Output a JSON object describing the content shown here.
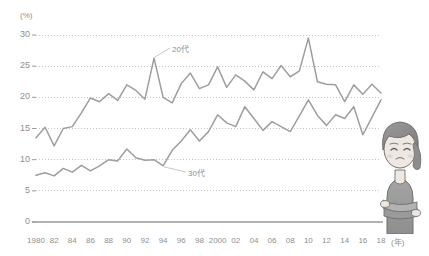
{
  "chart_data": {
    "type": "line",
    "title": "",
    "subtitle": "",
    "xlabel": "(年)",
    "ylabel": "(%)",
    "ylim": [
      0,
      30
    ],
    "xlim": [
      1980,
      2018
    ],
    "grid": true,
    "legend_position": "inline-annotation",
    "y_ticks": [
      "0",
      "5",
      "10",
      "15",
      "20",
      "25",
      "30"
    ],
    "y_tick_values": [
      0,
      5,
      10,
      15,
      20,
      25,
      30
    ],
    "x_ticks": [
      "1980",
      "82",
      "84",
      "86",
      "88",
      "90",
      "92",
      "94",
      "96",
      "98",
      "2000",
      "02",
      "04",
      "06",
      "08",
      "10",
      "12",
      "14",
      "16",
      "18"
    ],
    "x_tick_values": [
      1980,
      1982,
      1984,
      1986,
      1988,
      1990,
      1992,
      1994,
      1996,
      1998,
      2000,
      2002,
      2004,
      2006,
      2008,
      2010,
      2012,
      2014,
      2016,
      2018
    ],
    "x": [
      1980,
      1981,
      1982,
      1983,
      1984,
      1985,
      1986,
      1987,
      1988,
      1989,
      1990,
      1991,
      1992,
      1993,
      1994,
      1995,
      1996,
      1997,
      1998,
      1999,
      2000,
      2001,
      2002,
      2003,
      2004,
      2005,
      2006,
      2007,
      2008,
      2009,
      2010,
      2011,
      2012,
      2013,
      2014,
      2015,
      2016,
      2017,
      2018
    ],
    "series": [
      {
        "name": "20代",
        "color": "#9e9e9e",
        "annotation": "20代",
        "values": [
          13.5,
          15.2,
          12.2,
          15.0,
          15.3,
          17.5,
          19.9,
          19.3,
          20.6,
          19.5,
          22.0,
          21.1,
          19.7,
          26.3,
          20.0,
          19.1,
          22.2,
          23.9,
          21.4,
          22.0,
          24.9,
          21.6,
          23.6,
          22.6,
          21.2,
          24.1,
          23.0,
          25.1,
          23.3,
          24.2,
          29.5,
          22.5,
          22.1,
          22.0,
          19.3,
          22.0,
          20.5,
          22.1,
          20.7
        ]
      },
      {
        "name": "30代",
        "color": "#9e9e9e",
        "annotation": "30代",
        "values": [
          7.5,
          7.9,
          7.4,
          8.6,
          8.0,
          9.1,
          8.2,
          9.0,
          10.0,
          9.8,
          11.7,
          10.3,
          9.9,
          10.0,
          9.0,
          11.5,
          13.0,
          14.8,
          13.0,
          14.5,
          17.2,
          15.9,
          15.3,
          18.5,
          16.6,
          14.7,
          16.1,
          15.3,
          14.5,
          17.0,
          19.6,
          17.1,
          15.5,
          17.2,
          16.6,
          18.5,
          14.0,
          16.8,
          19.6
        ]
      }
    ]
  },
  "axis": {
    "y_unit": "(%)",
    "x_unit": "(年)"
  },
  "illustration": {
    "name": "woman-thinking-illustration",
    "alt": "Illustration of a woman with crossed arms looking worried"
  },
  "colors": {
    "line": "#9e9e9e",
    "grid": "#b8b8b8",
    "axis": "#9a9a9a",
    "text": "#8f8f8f",
    "background": "#ffffff"
  }
}
